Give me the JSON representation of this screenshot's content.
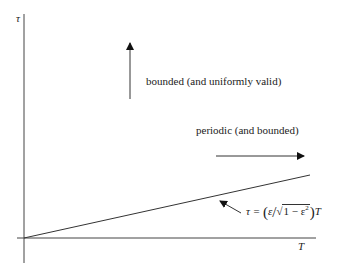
{
  "diagram": {
    "axes": {
      "y_label": "τ",
      "x_label": "T"
    },
    "regions": {
      "upper_label": "bounded (and uniformly valid)",
      "lower_label": "periodic (and bounded)"
    },
    "boundary": {
      "lhs": "τ = ",
      "open": "(",
      "eps": "ε",
      "slash": "/",
      "root": "√",
      "inside": "1 − ε",
      "sup": "2",
      "close": ")",
      "var": "T",
      "full": "τ = (ε/√(1−ε²)) T"
    },
    "colors": {
      "line": "#333333",
      "text": "#222222",
      "background": "#ffffff"
    }
  }
}
